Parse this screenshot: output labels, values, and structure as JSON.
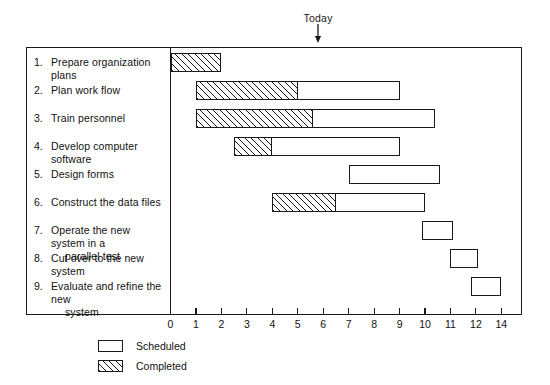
{
  "chart_data": {
    "type": "bar",
    "title": "",
    "subtitle": "",
    "xlabel": "",
    "ylabel": "",
    "xlim": [
      0,
      14
    ],
    "grid": false,
    "orientation": "horizontal",
    "legend_position": "bottom-left",
    "axis": {
      "tick_labels": [
        "0",
        "1",
        "2",
        "3",
        "4",
        "5",
        "6",
        "7",
        "8",
        "9",
        "10",
        "11",
        "12",
        "14"
      ],
      "tick_values": [
        0,
        1,
        2,
        3,
        4,
        5,
        6,
        7,
        8,
        9,
        10,
        11,
        12,
        13
      ]
    },
    "annotations": [
      {
        "name": "today",
        "label": "Today",
        "value": 5.8
      }
    ],
    "legend": [
      {
        "key": "scheduled",
        "label": "Scheduled",
        "fill": "open"
      },
      {
        "key": "completed",
        "label": "Completed",
        "fill": "hatched"
      }
    ],
    "categories": [
      "Prepare organization plans",
      "Plan work flow",
      "Train personnel",
      "Develop computer software",
      "Design forms",
      "Construct the data files",
      "Operate the new system in a parallel test",
      "Cut over to the new system",
      "Evaluate and refine the new system"
    ],
    "series": [
      {
        "name": "Scheduled",
        "values": [
          {
            "start": 0.0,
            "end": 2.0
          },
          {
            "start": 1.0,
            "end": 9.0
          },
          {
            "start": 1.0,
            "end": 10.4
          },
          {
            "start": 2.5,
            "end": 9.0
          },
          {
            "start": 7.0,
            "end": 10.6
          },
          {
            "start": 4.0,
            "end": 10.0
          },
          {
            "start": 9.9,
            "end": 11.1
          },
          {
            "start": 11.0,
            "end": 12.1
          },
          {
            "start": 11.8,
            "end": 13.0
          }
        ]
      },
      {
        "name": "Completed",
        "values": [
          {
            "start": 0.0,
            "end": 2.0
          },
          {
            "start": 1.0,
            "end": 5.0
          },
          {
            "start": 1.0,
            "end": 5.6
          },
          {
            "start": 2.5,
            "end": 4.0
          },
          null,
          {
            "start": 4.0,
            "end": 6.5
          },
          null,
          null,
          null
        ]
      }
    ]
  },
  "tasks": [
    {
      "num": "1.",
      "label": "Prepare organization plans",
      "cont": ""
    },
    {
      "num": "2.",
      "label": "Plan work flow",
      "cont": ""
    },
    {
      "num": "3.",
      "label": "Train personnel",
      "cont": ""
    },
    {
      "num": "4.",
      "label": "Develop computer software",
      "cont": ""
    },
    {
      "num": "5.",
      "label": "Design forms",
      "cont": ""
    },
    {
      "num": "6.",
      "label": "Construct the data files",
      "cont": ""
    },
    {
      "num": "7.",
      "label": "Operate the new system in a",
      "cont": "parallel test"
    },
    {
      "num": "8.",
      "label": "Cut over to the new system",
      "cont": ""
    },
    {
      "num": "9.",
      "label": "Evaluate and refine the new",
      "cont": "system"
    }
  ],
  "colors": {
    "ink": "#1a1a1a",
    "paper": "#ffffff"
  }
}
